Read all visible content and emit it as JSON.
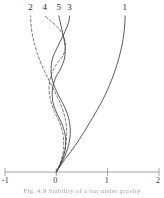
{
  "figure": {
    "caption": "Fig. 4.9    Stability of a bar under gravity",
    "caption_legible": false
  },
  "chart_data": {
    "type": "line",
    "title": "",
    "xlabel": "",
    "ylabel": "",
    "xlim": [
      -1,
      2
    ],
    "ylim": [
      0,
      1
    ],
    "grid": false,
    "legend": "inline-curve-labels",
    "axis": {
      "x_ticks": [
        -1,
        0,
        1,
        2
      ],
      "x_tick_labels": [
        "-1",
        "0",
        "1",
        "2"
      ],
      "y_axis_visible": false,
      "x_axis_visible": true
    },
    "series": [
      {
        "name": "1",
        "label": "1",
        "style": "solid",
        "color": "#3c3c3c",
        "label_x": 1.34,
        "label_y": 1.0,
        "points": [
          [
            0.0,
            0.0
          ],
          [
            0.12,
            0.06
          ],
          [
            0.28,
            0.13
          ],
          [
            0.45,
            0.21
          ],
          [
            0.62,
            0.3
          ],
          [
            0.8,
            0.4
          ],
          [
            0.96,
            0.5
          ],
          [
            1.1,
            0.61
          ],
          [
            1.21,
            0.72
          ],
          [
            1.29,
            0.83
          ],
          [
            1.33,
            0.93
          ],
          [
            1.34,
            1.0
          ]
        ]
      },
      {
        "name": "2",
        "label": "2",
        "style": "dashed",
        "color": "#5a5a5a",
        "label_x": -0.5,
        "label_y": 1.0,
        "points": [
          [
            0.0,
            0.0
          ],
          [
            0.1,
            0.07
          ],
          [
            0.17,
            0.15
          ],
          [
            0.2,
            0.24
          ],
          [
            0.18,
            0.33
          ],
          [
            0.1,
            0.42
          ],
          [
            -0.01,
            0.5
          ],
          [
            -0.13,
            0.58
          ],
          [
            -0.25,
            0.66
          ],
          [
            -0.36,
            0.75
          ],
          [
            -0.44,
            0.84
          ],
          [
            -0.49,
            0.93
          ],
          [
            -0.5,
            1.0
          ]
        ]
      },
      {
        "name": "3",
        "label": "3",
        "style": "solid",
        "color": "#3c3c3c",
        "label_x": 0.26,
        "label_y": 1.0,
        "points": [
          [
            0.0,
            0.0
          ],
          [
            0.12,
            0.07
          ],
          [
            0.22,
            0.15
          ],
          [
            0.27,
            0.24
          ],
          [
            0.25,
            0.33
          ],
          [
            0.17,
            0.41
          ],
          [
            0.06,
            0.48
          ],
          [
            -0.04,
            0.55
          ],
          [
            -0.1,
            0.63
          ],
          [
            -0.08,
            0.72
          ],
          [
            0.02,
            0.8
          ],
          [
            0.14,
            0.88
          ],
          [
            0.23,
            0.95
          ],
          [
            0.26,
            1.0
          ]
        ]
      },
      {
        "name": "4",
        "label": "4",
        "style": "dashed",
        "color": "#5a5a5a",
        "label_x": -0.22,
        "label_y": 1.0,
        "points": [
          [
            0.0,
            0.0
          ],
          [
            0.09,
            0.07
          ],
          [
            0.14,
            0.15
          ],
          [
            0.13,
            0.24
          ],
          [
            0.06,
            0.32
          ],
          [
            -0.04,
            0.39
          ],
          [
            -0.12,
            0.47
          ],
          [
            -0.14,
            0.56
          ],
          [
            -0.08,
            0.64
          ],
          [
            0.02,
            0.7
          ],
          [
            0.12,
            0.74
          ],
          [
            0.18,
            0.8
          ],
          [
            0.14,
            0.87
          ],
          [
            0.02,
            0.93
          ],
          [
            -0.12,
            0.97
          ],
          [
            -0.22,
            1.0
          ]
        ]
      },
      {
        "name": "5",
        "label": "5",
        "style": "solid",
        "color": "#3c3c3c",
        "label_x": 0.05,
        "label_y": 1.0,
        "points": [
          [
            0.0,
            0.0
          ],
          [
            0.1,
            0.07
          ],
          [
            0.17,
            0.14
          ],
          [
            0.18,
            0.22
          ],
          [
            0.12,
            0.3
          ],
          [
            0.02,
            0.37
          ],
          [
            -0.06,
            0.44
          ],
          [
            -0.08,
            0.52
          ],
          [
            -0.02,
            0.6
          ],
          [
            0.08,
            0.66
          ],
          [
            0.16,
            0.73
          ],
          [
            0.17,
            0.81
          ],
          [
            0.13,
            0.88
          ],
          [
            0.09,
            0.94
          ],
          [
            0.05,
            1.0
          ]
        ]
      }
    ]
  }
}
